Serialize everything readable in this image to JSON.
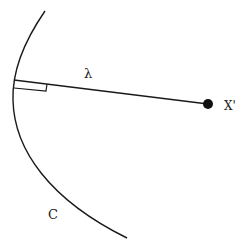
{
  "diagram": {
    "labels": {
      "lambda": "λ",
      "point": "X'",
      "curve": "C"
    },
    "colors": {
      "stroke": "#1a1a1a",
      "background": "#ffffff"
    }
  }
}
